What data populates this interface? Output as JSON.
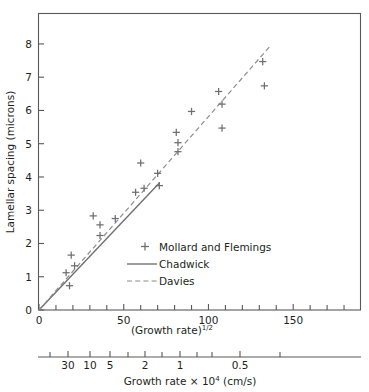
{
  "chart_data": {
    "type": "scatter",
    "title": "",
    "xlabel": "(Growth rate)^1/2",
    "xlabel_base": "(Growth rate)",
    "xlabel_exponent": "1/2",
    "ylabel": "Lamellar spacing (microns)",
    "xlim": [
      0,
      190
    ],
    "ylim": [
      0,
      8.9
    ],
    "xticks_major": [
      0,
      50,
      100,
      150
    ],
    "xticklabels_major": [
      "0",
      "50",
      "100",
      "150"
    ],
    "xticks_minor": [
      10,
      20,
      30,
      40,
      60,
      70,
      80,
      90,
      110,
      120,
      130,
      140,
      160,
      170,
      180
    ],
    "yticks": [
      0,
      1,
      2,
      3,
      4,
      5,
      6,
      7,
      8
    ],
    "yticklabels": [
      "0",
      "1",
      "2",
      "3",
      "4",
      "5",
      "6",
      "7",
      "8"
    ],
    "grid": false,
    "legend_position": "center",
    "secondary_axis": {
      "label_base": "Growth rate × 10",
      "label_exponent": "4",
      "label_tail": " (cm/s)",
      "label_full": "Growth rate × 10^4 (cm/s)",
      "ticklabels": [
        "30",
        "10",
        "5",
        "2",
        "1",
        "0.5"
      ],
      "tickvalues": [
        30,
        10,
        5,
        2,
        1,
        0.5
      ],
      "tick_x_px": [
        68,
        90,
        110,
        145,
        180,
        240
      ],
      "extra_tick_x_px": [
        50,
        128,
        162,
        197,
        212,
        280
      ],
      "line_x_start_px": 38,
      "line_x_end_px": 361
    },
    "series": [
      {
        "name": "Mollard and Flemings",
        "type": "scatter",
        "marker": "+",
        "color": "#6d6e71",
        "points": [
          {
            "x": 16,
            "y": 1.12
          },
          {
            "x": 18,
            "y": 0.73
          },
          {
            "x": 19,
            "y": 1.65
          },
          {
            "x": 21,
            "y": 1.33
          },
          {
            "x": 32,
            "y": 2.83
          },
          {
            "x": 36,
            "y": 2.56
          },
          {
            "x": 36,
            "y": 2.24
          },
          {
            "x": 45,
            "y": 2.75
          },
          {
            "x": 57,
            "y": 3.54
          },
          {
            "x": 60,
            "y": 4.42
          },
          {
            "x": 62,
            "y": 3.66
          },
          {
            "x": 70,
            "y": 4.11
          },
          {
            "x": 71,
            "y": 3.74
          },
          {
            "x": 81,
            "y": 5.34
          },
          {
            "x": 82,
            "y": 5.03
          },
          {
            "x": 82,
            "y": 4.76
          },
          {
            "x": 90,
            "y": 5.97
          },
          {
            "x": 106,
            "y": 6.57
          },
          {
            "x": 108,
            "y": 6.19
          },
          {
            "x": 108,
            "y": 5.47
          },
          {
            "x": 132,
            "y": 7.47
          },
          {
            "x": 133,
            "y": 6.74
          }
        ]
      },
      {
        "name": "Chadwick",
        "type": "line",
        "style": "solid",
        "color": "#6d6e71",
        "x": [
          0,
          71
        ],
        "y": [
          0,
          3.82
        ]
      },
      {
        "name": "Davies",
        "type": "line",
        "style": "dashed",
        "color": "#8b8c8e",
        "x": [
          0,
          137
        ],
        "y": [
          0,
          7.97
        ]
      }
    ],
    "legend": [
      {
        "label": "Mollard and Flemings",
        "marker": "plus"
      },
      {
        "label": "Chadwick",
        "marker": "solid-line"
      },
      {
        "label": "Davies",
        "marker": "dashed-line"
      }
    ]
  }
}
